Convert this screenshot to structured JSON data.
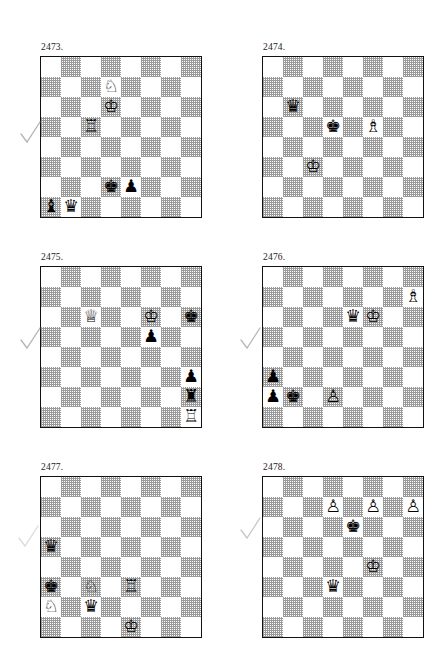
{
  "page": {
    "width": 434,
    "height": 651,
    "background": "#ffffff",
    "kind": "chess-puzzle-worksheet",
    "board_light_color": "#ffffff",
    "board_dark_color": "#9a9a9a",
    "board_border_color": "#111111",
    "checkmark_color": "#9b9b9b"
  },
  "glyphs": {
    "white_king": "♔",
    "white_queen": "♕",
    "white_rook": "♖",
    "white_bishop": "♗",
    "white_knight": "♘",
    "white_pawn": "♙",
    "black_king": "♚",
    "black_queen": "♛",
    "black_rook": "♜",
    "black_bishop": "♝",
    "black_knight": "♞",
    "black_pawn": "♟"
  },
  "puzzles": [
    {
      "number": "2473.",
      "x": 40,
      "y": 42,
      "checkmark": {
        "show": true,
        "x": 20,
        "y": 120,
        "opacity": 0.75
      },
      "pieces": [
        {
          "col": 3,
          "row": 1,
          "color": "white",
          "type": "knight",
          "glyph": "♘"
        },
        {
          "col": 3,
          "row": 2,
          "color": "white",
          "type": "king",
          "glyph": "♔"
        },
        {
          "col": 2,
          "row": 3,
          "color": "white",
          "type": "rook",
          "glyph": "♖"
        },
        {
          "col": 3,
          "row": 6,
          "color": "black",
          "type": "king",
          "glyph": "♚"
        },
        {
          "col": 4,
          "row": 6,
          "color": "black",
          "type": "pawn",
          "glyph": "♟"
        },
        {
          "col": 0,
          "row": 7,
          "color": "black",
          "type": "bishop",
          "glyph": "♝"
        },
        {
          "col": 1,
          "row": 7,
          "color": "black",
          "type": "queen",
          "glyph": "♛"
        }
      ]
    },
    {
      "number": "2474.",
      "x": 262,
      "y": 42,
      "checkmark": {
        "show": false,
        "x": 0,
        "y": 0,
        "opacity": 0
      },
      "pieces": [
        {
          "col": 1,
          "row": 2,
          "color": "black",
          "type": "queen",
          "glyph": "♛"
        },
        {
          "col": 3,
          "row": 3,
          "color": "black",
          "type": "king",
          "glyph": "♚"
        },
        {
          "col": 5,
          "row": 3,
          "color": "white",
          "type": "bishop",
          "glyph": "♗"
        },
        {
          "col": 2,
          "row": 5,
          "color": "white",
          "type": "king",
          "glyph": "♔"
        }
      ]
    },
    {
      "number": "2475.",
      "x": 40,
      "y": 252,
      "checkmark": {
        "show": true,
        "x": 20,
        "y": 326,
        "opacity": 0.75
      },
      "pieces": [
        {
          "col": 2,
          "row": 2,
          "color": "white",
          "type": "queen",
          "glyph": "♕"
        },
        {
          "col": 5,
          "row": 2,
          "color": "white",
          "type": "king",
          "glyph": "♔"
        },
        {
          "col": 7,
          "row": 2,
          "color": "black",
          "type": "king",
          "glyph": "♚"
        },
        {
          "col": 5,
          "row": 3,
          "color": "black",
          "type": "pawn",
          "glyph": "♟"
        },
        {
          "col": 7,
          "row": 5,
          "color": "black",
          "type": "pawn",
          "glyph": "♟"
        },
        {
          "col": 7,
          "row": 6,
          "color": "black",
          "type": "rook",
          "glyph": "♜"
        },
        {
          "col": 7,
          "row": 7,
          "color": "white",
          "type": "rook",
          "glyph": "♖"
        }
      ]
    },
    {
      "number": "2476.",
      "x": 262,
      "y": 252,
      "checkmark": {
        "show": true,
        "x": 240,
        "y": 326,
        "opacity": 0.7
      },
      "pieces": [
        {
          "col": 7,
          "row": 1,
          "color": "white",
          "type": "bishop",
          "glyph": "♗"
        },
        {
          "col": 4,
          "row": 2,
          "color": "black",
          "type": "queen",
          "glyph": "♛"
        },
        {
          "col": 5,
          "row": 2,
          "color": "white",
          "type": "king",
          "glyph": "♔"
        },
        {
          "col": 0,
          "row": 5,
          "color": "black",
          "type": "pawn",
          "glyph": "♟"
        },
        {
          "col": 0,
          "row": 6,
          "color": "black",
          "type": "pawn",
          "glyph": "♟"
        },
        {
          "col": 1,
          "row": 6,
          "color": "black",
          "type": "king",
          "glyph": "♚"
        },
        {
          "col": 3,
          "row": 6,
          "color": "white",
          "type": "pawn",
          "glyph": "♙"
        }
      ]
    },
    {
      "number": "2477.",
      "x": 40,
      "y": 462,
      "checkmark": {
        "show": true,
        "x": 18,
        "y": 524,
        "opacity": 0.35
      },
      "pieces": [
        {
          "col": 0,
          "row": 3,
          "color": "black",
          "type": "queen",
          "glyph": "♛"
        },
        {
          "col": 0,
          "row": 5,
          "color": "black",
          "type": "king",
          "glyph": "♚"
        },
        {
          "col": 2,
          "row": 5,
          "color": "white",
          "type": "knight",
          "glyph": "♘"
        },
        {
          "col": 4,
          "row": 5,
          "color": "white",
          "type": "rook",
          "glyph": "♖"
        },
        {
          "col": 0,
          "row": 6,
          "color": "white",
          "type": "knight",
          "glyph": "♘"
        },
        {
          "col": 2,
          "row": 6,
          "color": "black",
          "type": "queen",
          "glyph": "♛"
        },
        {
          "col": 4,
          "row": 7,
          "color": "white",
          "type": "king",
          "glyph": "♔"
        }
      ]
    },
    {
      "number": "2478.",
      "x": 262,
      "y": 462,
      "checkmark": {
        "show": true,
        "x": 240,
        "y": 516,
        "opacity": 0.55
      },
      "pieces": [
        {
          "col": 3,
          "row": 1,
          "color": "white",
          "type": "pawn",
          "glyph": "♙"
        },
        {
          "col": 5,
          "row": 1,
          "color": "white",
          "type": "pawn",
          "glyph": "♙"
        },
        {
          "col": 7,
          "row": 1,
          "color": "white",
          "type": "pawn",
          "glyph": "♙"
        },
        {
          "col": 4,
          "row": 2,
          "color": "black",
          "type": "king",
          "glyph": "♚"
        },
        {
          "col": 5,
          "row": 4,
          "color": "white",
          "type": "king",
          "glyph": "♔"
        },
        {
          "col": 3,
          "row": 5,
          "color": "black",
          "type": "queen",
          "glyph": "♛"
        }
      ]
    }
  ]
}
